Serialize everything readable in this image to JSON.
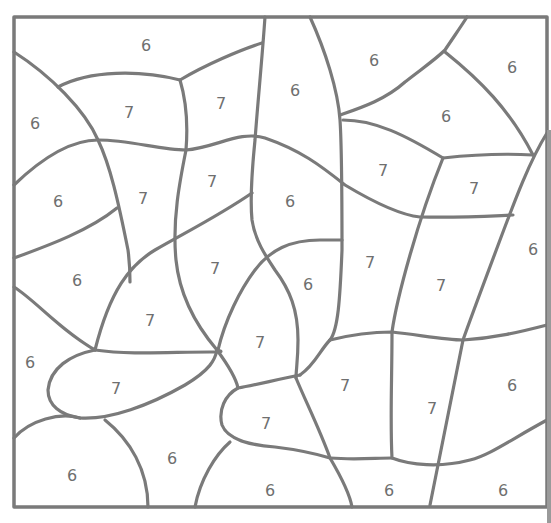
{
  "puzzle": {
    "type": "color-by-number",
    "line_color": "#7a7a7a",
    "regions": [
      {
        "label": "6",
        "x": 146,
        "y": 45
      },
      {
        "label": "6",
        "x": 295,
        "y": 90
      },
      {
        "label": "6",
        "x": 374,
        "y": 60
      },
      {
        "label": "6",
        "x": 512,
        "y": 67
      },
      {
        "label": "6",
        "x": 35,
        "y": 123
      },
      {
        "label": "7",
        "x": 129,
        "y": 112
      },
      {
        "label": "7",
        "x": 221,
        "y": 103
      },
      {
        "label": "6",
        "x": 446,
        "y": 116
      },
      {
        "label": "6",
        "x": 58,
        "y": 201
      },
      {
        "label": "7",
        "x": 143,
        "y": 198
      },
      {
        "label": "7",
        "x": 212,
        "y": 181
      },
      {
        "label": "6",
        "x": 290,
        "y": 201
      },
      {
        "label": "7",
        "x": 383,
        "y": 170
      },
      {
        "label": "7",
        "x": 474,
        "y": 188
      },
      {
        "label": "6",
        "x": 77,
        "y": 280
      },
      {
        "label": "7",
        "x": 215,
        "y": 268
      },
      {
        "label": "6",
        "x": 308,
        "y": 284
      },
      {
        "label": "7",
        "x": 370,
        "y": 262
      },
      {
        "label": "7",
        "x": 441,
        "y": 285
      },
      {
        "label": "6",
        "x": 533,
        "y": 249
      },
      {
        "label": "7",
        "x": 150,
        "y": 320
      },
      {
        "label": "7",
        "x": 260,
        "y": 342
      },
      {
        "label": "6",
        "x": 30,
        "y": 362
      },
      {
        "label": "7",
        "x": 116,
        "y": 388
      },
      {
        "label": "7",
        "x": 345,
        "y": 385
      },
      {
        "label": "6",
        "x": 512,
        "y": 385
      },
      {
        "label": "7",
        "x": 266,
        "y": 423
      },
      {
        "label": "7",
        "x": 432,
        "y": 408
      },
      {
        "label": "6",
        "x": 72,
        "y": 475
      },
      {
        "label": "6",
        "x": 172,
        "y": 458
      },
      {
        "label": "6",
        "x": 270,
        "y": 490
      },
      {
        "label": "6",
        "x": 389,
        "y": 490
      },
      {
        "label": "6",
        "x": 503,
        "y": 490
      }
    ]
  }
}
